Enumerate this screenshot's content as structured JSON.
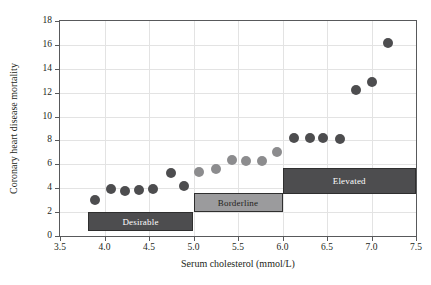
{
  "chart_data": {
    "type": "scatter",
    "title": "",
    "xlabel": "Serum cholesterol (mmol/L)",
    "ylabel": "Coronary heart disease mortality",
    "xlim": [
      3.5,
      7.5
    ],
    "ylim": [
      0,
      18
    ],
    "xticks": [
      "3.5",
      "4.0",
      "4.5",
      "5.0",
      "5.5",
      "6.0",
      "6.5",
      "7.0",
      "7.5"
    ],
    "xtick_values": [
      3.5,
      4.0,
      4.5,
      5.0,
      5.5,
      6.0,
      6.5,
      7.0,
      7.5
    ],
    "yticks": [
      "0",
      "2",
      "4",
      "6",
      "8",
      "10",
      "12",
      "14",
      "16",
      "18"
    ],
    "ytick_values": [
      0,
      2,
      4,
      6,
      8,
      10,
      12,
      14,
      16,
      18
    ],
    "grid": true,
    "legend": false,
    "marker_radius_px": 5,
    "series": [
      {
        "name": "Coronary heart disease mortality",
        "color": "#4d4d4f",
        "points": [
          {
            "x": 3.89,
            "y": 3.0,
            "color": "#4d4d4f"
          },
          {
            "x": 4.07,
            "y": 3.97,
            "color": "#4d4d4f"
          },
          {
            "x": 4.23,
            "y": 3.75,
            "color": "#4d4d4f"
          },
          {
            "x": 4.39,
            "y": 3.82,
            "color": "#4d4d4f"
          },
          {
            "x": 4.55,
            "y": 3.95,
            "color": "#4d4d4f"
          },
          {
            "x": 4.75,
            "y": 5.25,
            "color": "#4d4d4f"
          },
          {
            "x": 4.89,
            "y": 4.18,
            "color": "#4d4d4f"
          },
          {
            "x": 5.06,
            "y": 5.38,
            "color": "#8c8c8e"
          },
          {
            "x": 5.25,
            "y": 5.62,
            "color": "#8c8c8e"
          },
          {
            "x": 5.43,
            "y": 6.35,
            "color": "#8c8c8e"
          },
          {
            "x": 5.59,
            "y": 6.28,
            "color": "#8c8c8e"
          },
          {
            "x": 5.77,
            "y": 6.28,
            "color": "#8c8c8e"
          },
          {
            "x": 5.94,
            "y": 7.0,
            "color": "#8c8c8e"
          },
          {
            "x": 6.13,
            "y": 8.2,
            "color": "#4d4d4f"
          },
          {
            "x": 6.31,
            "y": 8.2,
            "color": "#4d4d4f"
          },
          {
            "x": 6.46,
            "y": 8.2,
            "color": "#4d4d4f"
          },
          {
            "x": 6.65,
            "y": 8.1,
            "color": "#4d4d4f"
          },
          {
            "x": 6.83,
            "y": 12.2,
            "color": "#4d4d4f"
          },
          {
            "x": 7.0,
            "y": 12.9,
            "color": "#4d4d4f"
          },
          {
            "x": 7.19,
            "y": 16.2,
            "color": "#4d4d4f"
          }
        ]
      }
    ],
    "bands": [
      {
        "label": "Desirable",
        "x0": 3.81,
        "x1": 5.0,
        "y0": 0.42,
        "y1": 1.98,
        "fill": "#4d4d4f",
        "text_color": "#ffffff"
      },
      {
        "label": "Borderline",
        "x0": 5.0,
        "x1": 6.0,
        "y0": 1.98,
        "y1": 3.6,
        "fill": "#9b9b9d",
        "text_color": "#231f20"
      },
      {
        "label": "Elevated",
        "x0": 6.0,
        "x1": 7.5,
        "y0": 3.5,
        "y1": 5.66,
        "fill": "#4d4d4f",
        "text_color": "#ffffff"
      }
    ]
  },
  "figure": {
    "background": "#ffffff",
    "axis_color": "#58595b",
    "grid_color": "#e3e3e3"
  }
}
